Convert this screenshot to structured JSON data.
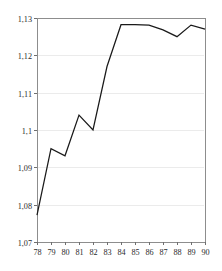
{
  "chart_data": {
    "type": "line",
    "title": "",
    "subtitle": "",
    "xlabel": "",
    "ylabel": "",
    "x": [
      78,
      79,
      80,
      81,
      82,
      83,
      84,
      85,
      86,
      87,
      88,
      89,
      90
    ],
    "xtick_labels": [
      "78",
      "79",
      "80",
      "81",
      "82",
      "83",
      "84",
      "85",
      "86",
      "87",
      "88",
      "89",
      "90"
    ],
    "ytick_labels": [
      "1,07",
      "1,08",
      "1,09",
      "1,1",
      "1,11",
      "1,12",
      "1,13"
    ],
    "ytick_values": [
      1.07,
      1.08,
      1.09,
      1.1,
      1.11,
      1.12,
      1.13
    ],
    "series": [
      {
        "name": "series-1",
        "color": "#1a1a1a",
        "values": [
          1.0772,
          1.095,
          1.0931,
          1.104,
          1.1,
          1.117,
          1.1282,
          1.1282,
          1.1281,
          1.1268,
          1.125,
          1.1281,
          1.127
        ]
      }
    ],
    "xlim": [
      78,
      90
    ],
    "ylim": [
      1.07,
      1.13
    ],
    "grid": true,
    "grid_axis": "y",
    "legend": false,
    "legend_position": "none",
    "frame_color": "#8d8d8d",
    "grid_color": "#ebebeb",
    "background": "#ffffff"
  },
  "layout": {
    "plot_left": 37,
    "plot_right": 205,
    "plot_top": 18,
    "plot_bottom": 242
  }
}
